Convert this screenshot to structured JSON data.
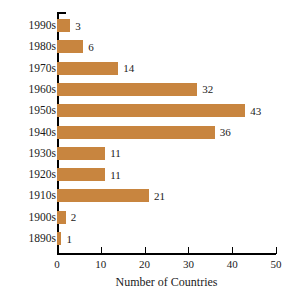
{
  "chart_data": {
    "type": "bar",
    "orientation": "horizontal",
    "title": "",
    "xlabel": "Number of Countries",
    "ylabel": "",
    "categories": [
      "1990s",
      "1980s",
      "1970s",
      "1960s",
      "1950s",
      "1940s",
      "1930s",
      "1920s",
      "1910s",
      "1900s",
      "1890s"
    ],
    "values": [
      3,
      6,
      14,
      32,
      43,
      36,
      11,
      11,
      21,
      2,
      1
    ],
    "value_labels": [
      "3",
      "6",
      "14",
      "32",
      "43",
      "36",
      "11",
      "11",
      "21",
      "2",
      "1"
    ],
    "xticks": [
      0,
      10,
      20,
      30,
      40,
      50
    ],
    "xtick_labels": [
      "0",
      "10",
      "20",
      "30",
      "40",
      "50"
    ],
    "xlim": [
      0,
      50
    ],
    "grid": false,
    "legend": null,
    "bar_color": "#C8853F",
    "axis_color": "#000000",
    "text_color": "#1a1a1a",
    "background": "#ffffff"
  }
}
